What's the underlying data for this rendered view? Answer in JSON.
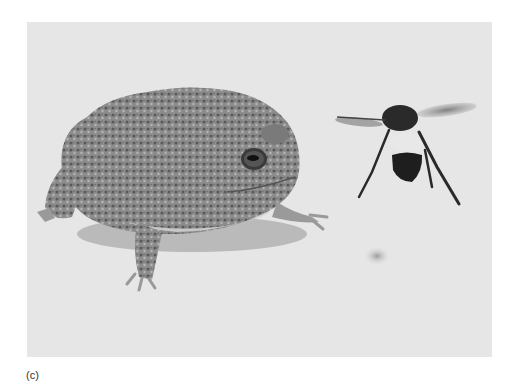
{
  "figure": {
    "caption_label": "(c)",
    "subjects": [
      "toad",
      "bumblebee"
    ],
    "colors": {
      "background": "#e6e6e6",
      "toad_body": "#8a8a8a",
      "toad_belly": "#c8c8c8",
      "bee_body": "#1e1e1e",
      "bee_band": "#e8e8e8",
      "shadow": "#9a9a9a"
    }
  }
}
